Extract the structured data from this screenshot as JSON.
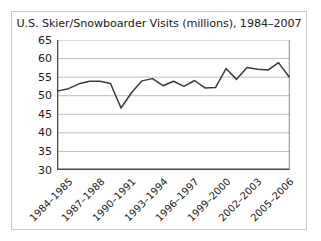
{
  "chart_data": {
    "type": "line",
    "title": "U.S. Skier/Snowboarder Visits (millions), 1984–2007",
    "xlabel": "",
    "ylabel": "",
    "ylim": [
      30,
      65
    ],
    "yticks": [
      30,
      35,
      40,
      45,
      50,
      55,
      60,
      65
    ],
    "ytick_labels": [
      "30",
      "35",
      "40",
      "45",
      "50",
      "55",
      "60",
      "65"
    ],
    "grid": true,
    "grid_axis": "y",
    "legend": false,
    "line_color": "#3a3a3a",
    "background_color": "#ffffff",
    "frame_color": "#c9c9c9",
    "categories": [
      "1984–1985",
      "1985–1986",
      "1986–1987",
      "1987–1988",
      "1988–1989",
      "1989–1990",
      "1990–1991",
      "1991–1992",
      "1992–1993",
      "1993–1994",
      "1994–1995",
      "1995–1996",
      "1996–1997",
      "1997–1998",
      "1998–1999",
      "1999–2000",
      "2000–2001",
      "2001–2002",
      "2002–2003",
      "2003–2004",
      "2004–2005",
      "2005–2006",
      "2006–2007"
    ],
    "xtick_labels": [
      "1984–1985",
      "1987–1988",
      "1990–1991",
      "1993–1994",
      "1996–1997",
      "1999–2000",
      "2002–2003",
      "2005–2006"
    ],
    "xtick_indices": [
      0,
      3,
      6,
      9,
      12,
      15,
      18,
      21
    ],
    "values": [
      51.3,
      51.9,
      53.2,
      53.9,
      53.9,
      53.3,
      46.7,
      50.8,
      54.0,
      54.6,
      52.7,
      53.9,
      52.5,
      54.1,
      52.1,
      52.2,
      57.3,
      54.4,
      57.6,
      57.1,
      56.9,
      58.9,
      55.1
    ],
    "series_name": "U.S. Skier/Snowboarder Visits"
  }
}
